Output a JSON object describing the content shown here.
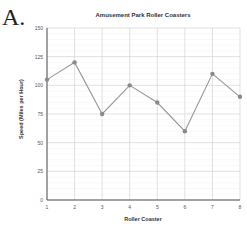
{
  "panel_label": "A.",
  "chart_data": {
    "type": "line",
    "title": "Amusement Park Roller Coasters",
    "xlabel": "Roller Coaster",
    "ylabel": "Speed (Miles per Hour)",
    "categories": [
      "1",
      "2",
      "3",
      "4",
      "5",
      "6",
      "7",
      "8"
    ],
    "series": [
      {
        "name": "Speed",
        "values": [
          105,
          120,
          75,
          100,
          85,
          60,
          110,
          90
        ],
        "color": "#999999"
      }
    ],
    "yticks": [
      0,
      25,
      50,
      75,
      100,
      125,
      150
    ],
    "ylim": [
      0,
      150
    ],
    "grid": true,
    "legend": "none"
  }
}
